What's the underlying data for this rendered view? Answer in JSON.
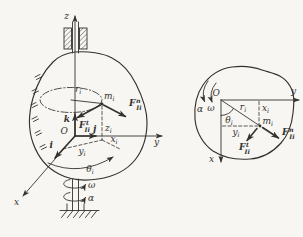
{
  "colors": {
    "background": "#f7f6f2",
    "ink": "#34322e"
  },
  "left": {
    "axis_z": "z",
    "axis_y": "y",
    "axis_x": "x",
    "origin": "O",
    "vec_i": "i",
    "vec_j": "j",
    "vec_k": "k",
    "mass_base": "m",
    "mass_sub": "i",
    "radius_base": "r",
    "radius_sub": "i",
    "coord_x_base": "x",
    "coord_x_sub": "i",
    "coord_y_base": "y",
    "coord_y_sub": "i",
    "coord_z_base": "z",
    "coord_z_sub": "i",
    "angle_base": "θ",
    "angle_sub": "i",
    "force_n_base": "F",
    "force_n_sup": "n",
    "force_n_sub": "Ii",
    "force_t_base": "F",
    "force_t_sup": "t",
    "force_t_sub": "Ii",
    "omega": "ω",
    "alpha": "α"
  },
  "right": {
    "axis_y": "y",
    "axis_x": "x",
    "origin": "O",
    "mass_base": "m",
    "mass_sub": "i",
    "radius_base": "r",
    "radius_sub": "i",
    "coord_x_base": "x",
    "coord_x_sub": "i",
    "coord_y_base": "y",
    "coord_y_sub": "i",
    "angle_base": "θ",
    "angle_sub": "i",
    "force_n_base": "F",
    "force_n_sup": "n",
    "force_n_sub": "Ii",
    "force_t_base": "F",
    "force_t_sup": "t",
    "force_t_sub": "Ii",
    "omega": "ω",
    "alpha": "α"
  }
}
